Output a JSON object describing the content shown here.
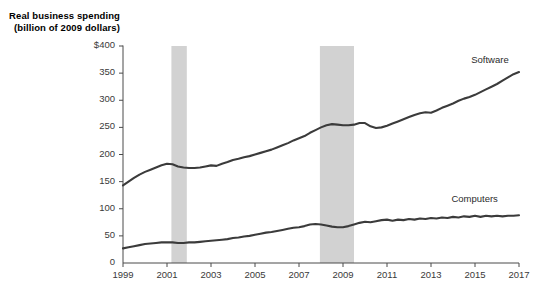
{
  "chart_data": {
    "type": "line",
    "title": "Real business spending",
    "subtitle": "(billion of 2009 dollars)",
    "ylabel": "Real business spending (billion of 2009 dollars)",
    "xlabel": "",
    "ylim": [
      0,
      400
    ],
    "xlim": [
      1999,
      2017
    ],
    "grid": false,
    "legend_position": "inline-right",
    "y_ticks": [
      "0",
      "50",
      "100",
      "150",
      "200",
      "250",
      "300",
      "350",
      "$400"
    ],
    "y_tick_values": [
      0,
      50,
      100,
      150,
      200,
      250,
      300,
      350,
      400
    ],
    "x_ticks": [
      "1999",
      "2001",
      "2003",
      "2005",
      "2007",
      "2009",
      "2011",
      "2013",
      "2015",
      "2017"
    ],
    "x_tick_values": [
      1999,
      2001,
      2003,
      2005,
      2007,
      2009,
      2011,
      2013,
      2015,
      2017
    ],
    "series": [
      {
        "name": "Software",
        "color": "#3b3b3b",
        "label_x": 2016.1,
        "label_y": 372,
        "x": [
          1999.0,
          1999.25,
          1999.5,
          1999.75,
          2000.0,
          2000.25,
          2000.5,
          2000.75,
          2001.0,
          2001.25,
          2001.5,
          2001.75,
          2002.0,
          2002.25,
          2002.5,
          2002.75,
          2003.0,
          2003.25,
          2003.5,
          2003.75,
          2004.0,
          2004.25,
          2004.5,
          2004.75,
          2005.0,
          2005.25,
          2005.5,
          2005.75,
          2006.0,
          2006.25,
          2006.5,
          2006.75,
          2007.0,
          2007.25,
          2007.5,
          2007.75,
          2008.0,
          2008.25,
          2008.5,
          2008.75,
          2009.0,
          2009.25,
          2009.5,
          2009.75,
          2010.0,
          2010.25,
          2010.5,
          2010.75,
          2011.0,
          2011.25,
          2011.5,
          2011.75,
          2012.0,
          2012.25,
          2012.5,
          2012.75,
          2013.0,
          2013.25,
          2013.5,
          2013.75,
          2014.0,
          2014.25,
          2014.5,
          2014.75,
          2015.0,
          2015.25,
          2015.5,
          2015.75,
          2016.0,
          2016.25,
          2016.5,
          2016.75,
          2017.0
        ],
        "values": [
          143,
          150,
          157,
          163,
          168,
          172,
          176,
          180,
          183,
          182,
          178,
          176,
          175,
          175,
          176,
          178,
          180,
          179,
          183,
          186,
          190,
          192,
          195,
          197,
          200,
          203,
          206,
          209,
          213,
          217,
          221,
          226,
          230,
          234,
          240,
          245,
          250,
          254,
          256,
          255,
          254,
          254,
          255,
          258,
          258,
          252,
          249,
          250,
          253,
          257,
          261,
          265,
          269,
          273,
          276,
          278,
          277,
          281,
          286,
          290,
          294,
          299,
          303,
          306,
          310,
          315,
          320,
          325,
          330,
          336,
          342,
          348,
          352
        ]
      },
      {
        "name": "Computers",
        "color": "#3b3b3b",
        "label_x": 2015.2,
        "label_y": 116,
        "x": [
          1999.0,
          1999.25,
          1999.5,
          1999.75,
          2000.0,
          2000.25,
          2000.5,
          2000.75,
          2001.0,
          2001.25,
          2001.5,
          2001.75,
          2002.0,
          2002.25,
          2002.5,
          2002.75,
          2003.0,
          2003.25,
          2003.5,
          2003.75,
          2004.0,
          2004.25,
          2004.5,
          2004.75,
          2005.0,
          2005.25,
          2005.5,
          2005.75,
          2006.0,
          2006.25,
          2006.5,
          2006.75,
          2007.0,
          2007.25,
          2007.5,
          2007.75,
          2008.0,
          2008.25,
          2008.5,
          2008.75,
          2009.0,
          2009.25,
          2009.5,
          2009.75,
          2010.0,
          2010.25,
          2010.5,
          2010.75,
          2011.0,
          2011.25,
          2011.5,
          2011.75,
          2012.0,
          2012.25,
          2012.5,
          2012.75,
          2013.0,
          2013.25,
          2013.5,
          2013.75,
          2014.0,
          2014.25,
          2014.5,
          2014.75,
          2015.0,
          2015.25,
          2015.5,
          2015.75,
          2016.0,
          2016.25,
          2016.5,
          2016.75,
          2017.0
        ],
        "values": [
          27,
          29,
          31,
          33,
          35,
          36,
          37,
          38,
          38,
          38,
          37,
          37,
          38,
          38,
          39,
          40,
          41,
          42,
          43,
          44,
          46,
          47,
          49,
          50,
          52,
          54,
          56,
          57,
          59,
          61,
          63,
          65,
          66,
          68,
          71,
          72,
          71,
          69,
          67,
          66,
          66,
          68,
          71,
          74,
          76,
          75,
          77,
          79,
          80,
          78,
          80,
          79,
          81,
          80,
          82,
          81,
          83,
          82,
          84,
          83,
          85,
          84,
          86,
          85,
          87,
          85,
          87,
          86,
          87,
          86,
          87,
          87,
          88
        ]
      }
    ],
    "shaded_regions": [
      {
        "name": "recession-2001",
        "x_start": 2001.2,
        "x_end": 2001.9,
        "color": "#d2d2d2",
        "y_top": 400
      },
      {
        "name": "recession-2008",
        "x_start": 2007.95,
        "x_end": 2009.5,
        "color": "#d2d2d2",
        "y_top": 400
      }
    ]
  }
}
